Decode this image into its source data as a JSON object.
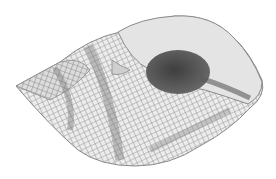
{
  "image": {
    "subject": "spiral gastropod shell illustration",
    "style": "grayscale engraving",
    "background": "#ffffff",
    "colors": {
      "shell_light": "#e8e8e8",
      "shell_mid": "#b5b5b5",
      "shell_dark": "#7a7a7a",
      "aperture": "#4a4a4a",
      "outline": "#8a8a8a"
    }
  }
}
